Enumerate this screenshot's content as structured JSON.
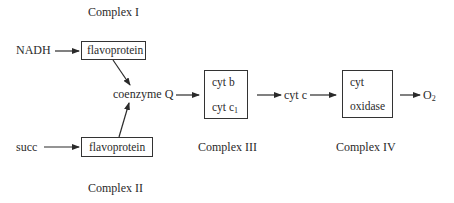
{
  "diagram": {
    "complex_labels": {
      "complex_1": "Complex I",
      "complex_2": "Complex II",
      "complex_3": "Complex III",
      "complex_4": "Complex IV"
    },
    "nodes": {
      "nadh": "NADH",
      "succ": "succ",
      "flavoprotein_1": "flavoprotein",
      "flavoprotein_2": "flavoprotein",
      "coenzyme_q": "coenzyme Q",
      "cyt_b": "cyt b",
      "cyt_c1": "cyt c",
      "cyt_c1_sub": "1",
      "cyt_c": "cyt c",
      "cyt_oxidase_line1": "cyt",
      "cyt_oxidase_line2": "oxidase",
      "o2": "O",
      "o2_sub": "2"
    },
    "edges": [
      {
        "from": "NADH",
        "to": "flavoprotein (Complex I)"
      },
      {
        "from": "succ",
        "to": "flavoprotein (Complex II)"
      },
      {
        "from": "flavoprotein (Complex I)",
        "to": "coenzyme Q"
      },
      {
        "from": "flavoprotein (Complex II)",
        "to": "coenzyme Q"
      },
      {
        "from": "coenzyme Q",
        "to": "Complex III"
      },
      {
        "from": "Complex III",
        "to": "cyt c"
      },
      {
        "from": "cyt c",
        "to": "Complex IV"
      },
      {
        "from": "Complex IV",
        "to": "O2"
      }
    ],
    "colors": {
      "ink": "#2a2a2a",
      "background": "#ffffff"
    }
  }
}
